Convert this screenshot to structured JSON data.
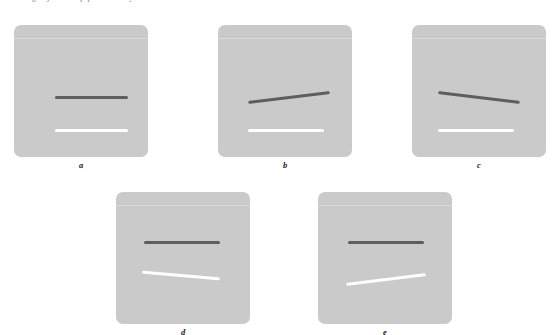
{
  "figure": {
    "background_color": "#ffffff",
    "panel_color": "#cacaca",
    "dark_line_color": "#5e5e5e",
    "light_line_color": "#ffffff",
    "truncated_caption_text": "a b c d e f g h i j k l m n o p q r s t u v w x y z",
    "panels": [
      {
        "label": "a",
        "position": {
          "left": 14,
          "top": 25
        },
        "dark_line": {
          "label": "reference line",
          "orientation": "horizontal",
          "tilt_degrees": 0,
          "left": 41,
          "top": 71,
          "length": 73
        },
        "light_line": {
          "label": "comparison line",
          "orientation": "horizontal",
          "tilt_degrees": 0,
          "left": 41,
          "top": 104,
          "length": 73
        }
      },
      {
        "label": "b",
        "position": {
          "left": 218,
          "top": 25
        },
        "dark_line": {
          "label": "reference line",
          "orientation": "tilted",
          "tilt_degrees": -7,
          "left": 30,
          "top": 71,
          "length": 82
        },
        "light_line": {
          "label": "comparison line",
          "orientation": "horizontal",
          "tilt_degrees": 0,
          "left": 30,
          "top": 104,
          "length": 76
        }
      },
      {
        "label": "c",
        "position": {
          "left": 412,
          "top": 25
        },
        "dark_line": {
          "label": "reference line",
          "orientation": "tilted",
          "tilt_degrees": 7,
          "left": 26,
          "top": 71,
          "length": 82
        },
        "light_line": {
          "label": "comparison line",
          "orientation": "horizontal",
          "tilt_degrees": 0,
          "left": 26,
          "top": 104,
          "length": 76
        }
      },
      {
        "label": "d",
        "position": {
          "left": 116,
          "top": 192
        },
        "dark_line": {
          "label": "reference line",
          "orientation": "horizontal",
          "tilt_degrees": 0,
          "left": 28,
          "top": 49,
          "length": 76
        },
        "light_line": {
          "label": "comparison line",
          "orientation": "tilted",
          "tilt_degrees": 5,
          "left": 26,
          "top": 82,
          "length": 78
        }
      },
      {
        "label": "e",
        "position": {
          "left": 318,
          "top": 192
        },
        "dark_line": {
          "label": "reference line",
          "orientation": "horizontal",
          "tilt_degrees": 0,
          "left": 30,
          "top": 49,
          "length": 76
        },
        "light_line": {
          "label": "comparison line",
          "orientation": "tilted",
          "tilt_degrees": -7,
          "left": 28,
          "top": 86,
          "length": 80
        }
      }
    ]
  }
}
